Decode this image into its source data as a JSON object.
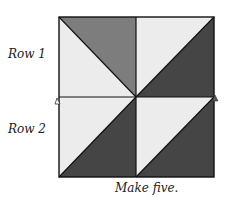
{
  "labels": {
    "row1": "Row 1",
    "row2": "Row 2",
    "caption": "Make five."
  },
  "colors": {
    "light": "#ececec",
    "medium": "#7d7d7d",
    "dark": "#454545",
    "outline": "#111111"
  },
  "block": {
    "x": 59,
    "y": 17,
    "x2": 214,
    "y2": 177,
    "cx": 136,
    "cy": 97,
    "quadrants": [
      {
        "position": "top-left",
        "diagonal": "top-left to bottom-right",
        "upper_triangle": "medium",
        "lower_triangle": "light"
      },
      {
        "position": "top-right",
        "diagonal": "bottom-left to top-right",
        "upper_triangle": "light",
        "lower_triangle": "dark"
      },
      {
        "position": "bottom-left",
        "diagonal": "bottom-left to top-right",
        "upper_triangle": "light",
        "lower_triangle": "dark"
      },
      {
        "position": "bottom-right",
        "diagonal": "bottom-left to top-right",
        "upper_triangle": "light",
        "lower_triangle": "dark"
      }
    ]
  },
  "markers": [
    {
      "name": "seam-arrow-left",
      "shape": "triangle"
    },
    {
      "name": "seam-arrow-right",
      "shape": "triangle"
    }
  ]
}
